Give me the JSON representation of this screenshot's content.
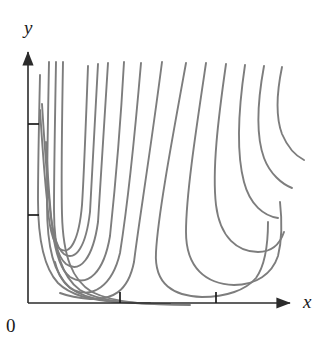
{
  "figure": {
    "kind": "level-curves-contour-plot",
    "title": "",
    "background_color": "#ffffff"
  },
  "axes": {
    "x_label": "x",
    "y_label": "y",
    "origin_label": "0",
    "axis_color": "#2b2b2b",
    "axis_line_width": 1.6,
    "x_axis": {
      "start_px": [
        28,
        303
      ],
      "end_px": [
        297,
        303
      ],
      "arrow": true,
      "ticks_px": [
        120,
        216
      ],
      "tick_length": 11,
      "tick_labels": [
        "",
        ""
      ]
    },
    "y_axis": {
      "start_px": [
        28,
        303
      ],
      "end_px": [
        28,
        50
      ],
      "arrow": true,
      "ticks_px": [
        215,
        124
      ],
      "tick_length": 11,
      "tick_labels": [
        "",
        ""
      ]
    }
  },
  "chart_data": {
    "type": "line",
    "title": "",
    "xlabel": "x",
    "ylabel": "y",
    "xlim": [
      0,
      10
    ],
    "ylim": [
      0,
      10
    ],
    "grid": false,
    "legend": "none",
    "annotations": [
      "0"
    ],
    "series_color": "#7d7d7d",
    "series_line_width": 1.9,
    "series_count": 13,
    "series": [
      {
        "name": "level-curve-1",
        "path": "M 40,75 C 39,120 38,165 38,200 C 38,240 44,268 58,283 C 72,297 96,301 120,302",
        "enters": "top",
        "exits": "bottom"
      },
      {
        "name": "level-curve-2",
        "path": "M 49,62 C 48,115 47,170 47,205 C 47,248 54,274 70,288 C 88,301 118,303 150,303",
        "enters": "top",
        "exits": "bottom"
      },
      {
        "name": "level-curve-3",
        "path": "M 56,62 C 55,118 54,172 54,210 C 54,252 62,277 80,290 C 100,302 134,304 170,304",
        "enters": "top",
        "exits": "bottom"
      },
      {
        "name": "level-curve-4",
        "path": "M 63,62 C 62,120 61,175 62,214 C 63,256 72,280 92,292 C 114,303 150,305 190,305",
        "enters": "top",
        "exits": "bottom"
      },
      {
        "name": "level-curve-5",
        "path": "M 88,66 C 86,120 84,175 82,205 C 79,240 70,256 60,249 C 52,243 49,225 47,200 C 44,172 42,140 40,110",
        "enters": "top",
        "exits": "left",
        "turning": true
      },
      {
        "name": "level-curve-6",
        "path": "M 98,64 C 95,125 92,180 90,212 C 86,246 76,262 64,254 C 55,247 51,226 49,198 C 46,168 44,136 42,104",
        "enters": "top",
        "exits": "left",
        "turning": true
      },
      {
        "name": "level-curve-7",
        "path": "M 108,63 C 104,130 100,188 98,222 C 93,258 80,274 66,264 C 56,256 52,232 50,204 C 48,180 47,160 46,142",
        "enters": "top",
        "exits": "left",
        "turning": true
      },
      {
        "name": "level-curve-8",
        "path": "M 124,62 C 120,135 114,198 110,236 C 104,272 88,288 70,277 C 60,270 55,250 52,228",
        "enters": "top",
        "exits": "left",
        "turning": true
      },
      {
        "name": "level-curve-9",
        "path": "M 141,63 C 134,145 126,215 120,253 C 112,287 92,298 74,290 C 64,285 58,274 55,262",
        "enters": "top",
        "exits": "left",
        "turning": true
      },
      {
        "name": "level-curve-10",
        "path": "M 162,62 C 150,155 138,228 134,262 C 128,292 112,300 90,299 C 78,298 68,296 60,293",
        "enters": "top",
        "exits": "left",
        "turning": true
      },
      {
        "name": "level-curve-11",
        "path": "M 186,63 C 172,140 158,215 156,252 C 154,285 174,296 202,297 C 226,297 246,290 256,278 C 266,264 268,242 268,222",
        "enters": "top",
        "exits": "right",
        "turning": true
      },
      {
        "name": "level-curve-12",
        "path": "M 206,63 C 196,130 186,195 186,232 C 186,268 206,284 234,285 C 256,285 272,274 278,256 C 282,240 282,220 280,202",
        "enters": "top",
        "exits": "right",
        "turning": true
      },
      {
        "name": "level-curve-13",
        "path": "M 226,64 C 218,120 212,170 216,205 C 220,238 238,252 258,252 C 272,252 280,244 284,232",
        "enters": "top",
        "exits": "right",
        "turning": true
      },
      {
        "name": "level-curve-14",
        "path": "M 245,65 C 238,112 236,152 244,182 C 250,205 264,216 278,218",
        "enters": "top",
        "exits": "right"
      },
      {
        "name": "level-curve-15",
        "path": "M 264,66 C 257,104 256,136 264,158 C 270,174 282,184 292,188",
        "enters": "top",
        "exits": "right"
      },
      {
        "name": "level-curve-16",
        "path": "M 282,67 C 276,96 276,118 282,134 C 288,148 296,156 304,160",
        "enters": "top",
        "exits": "right"
      }
    ]
  }
}
